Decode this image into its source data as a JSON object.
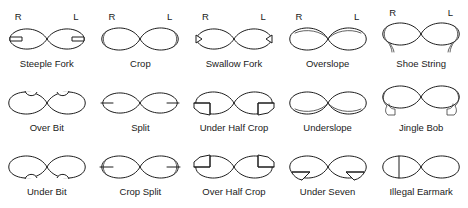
{
  "figure": {
    "side_labels": {
      "right": "R",
      "left": "L"
    },
    "background_color": "#ffffff",
    "line_color": "#1d1d1d",
    "columns": 5,
    "rows": 3
  },
  "marks": [
    {
      "id": "steeple-fork",
      "label": "Steeple Fork",
      "row": 1,
      "col": 1,
      "show_rl": true,
      "detail": "narrow horizontal notch cut into each outer tip"
    },
    {
      "id": "crop",
      "label": "Crop",
      "row": 1,
      "col": 2,
      "show_rl": true,
      "detail": "outer tip squared off, double outline at each end"
    },
    {
      "id": "swallow-fork",
      "label": "Swallow Fork",
      "row": 1,
      "col": 3,
      "show_rl": true,
      "detail": "small V notch cut into each outer tip"
    },
    {
      "id": "overslope",
      "label": "Overslope",
      "row": 1,
      "col": 4,
      "show_rl": true,
      "detail": "upper edge sloped away on both ears"
    },
    {
      "id": "shoe-string",
      "label": "Shoe String",
      "row": 1,
      "col": 5,
      "show_rl": true,
      "detail": "thin strip cut and left dangling below each ear"
    },
    {
      "id": "over-bit",
      "label": "Over Bit",
      "row": 2,
      "col": 1,
      "show_rl": false,
      "detail": "small semicircular bite out of the top edge"
    },
    {
      "id": "split",
      "label": "Split",
      "row": 2,
      "col": 2,
      "show_rl": false,
      "detail": "horizontal slit into each outer tip"
    },
    {
      "id": "under-half-crop",
      "label": "Under Half Crop",
      "row": 2,
      "col": 3,
      "show_rl": false,
      "detail": "lower half of outer tip squared off"
    },
    {
      "id": "underslope",
      "label": "Underslope",
      "row": 2,
      "col": 4,
      "show_rl": false,
      "detail": "lower edge sloped away on both ears"
    },
    {
      "id": "jingle-bob",
      "label": "Jingle Bob",
      "row": 2,
      "col": 5,
      "show_rl": false,
      "detail": "large flap cut and left hanging under each ear"
    },
    {
      "id": "under-bit",
      "label": "Under Bit",
      "row": 3,
      "col": 1,
      "show_rl": false,
      "detail": "small semicircular bite out of the bottom edge"
    },
    {
      "id": "crop-split",
      "label": "Crop Split",
      "row": 3,
      "col": 2,
      "show_rl": false,
      "detail": "cropped tip with a horizontal slit through it"
    },
    {
      "id": "over-half-crop",
      "label": "Over Half Crop",
      "row": 3,
      "col": 3,
      "show_rl": false,
      "detail": "upper half of outer tip squared off"
    },
    {
      "id": "under-seven",
      "label": "Under Seven",
      "row": 3,
      "col": 4,
      "show_rl": false,
      "detail": "seven-shaped cut from the lower edge"
    },
    {
      "id": "illegal-earmark",
      "label": "Illegal Earmark",
      "row": 3,
      "col": 5,
      "show_rl": false,
      "detail": "vertical line severing the right ear"
    }
  ]
}
